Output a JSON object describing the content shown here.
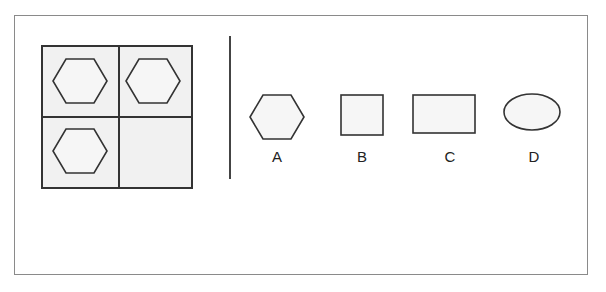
{
  "puzzle": {
    "grid": {
      "cells": [
        {
          "position": "top-left",
          "shape": "hexagon"
        },
        {
          "position": "top-right",
          "shape": "hexagon"
        },
        {
          "position": "bottom-left",
          "shape": "hexagon"
        },
        {
          "position": "bottom-right",
          "shape": "empty"
        }
      ]
    },
    "options": [
      {
        "label": "A",
        "shape": "hexagon"
      },
      {
        "label": "B",
        "shape": "square"
      },
      {
        "label": "C",
        "shape": "rectangle"
      },
      {
        "label": "D",
        "shape": "ellipse"
      }
    ],
    "colors": {
      "stroke": "#333333",
      "fill": "#f1f1f1",
      "frame": "#8a8a8a"
    }
  }
}
